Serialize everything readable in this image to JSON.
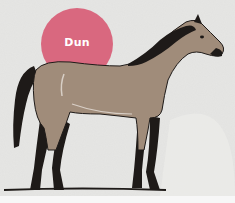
{
  "image": {
    "description": "Illustration of a dun-colored horse standing in profile facing right, with a circular badge label",
    "badge": {
      "label": "Dun",
      "color": "#d9687f"
    },
    "colors": {
      "background": "#e2e2e0",
      "horse_body": "#a08c7a",
      "mane_tail_legs": "#1e1a18",
      "ground_line": "#1e1a18",
      "bottom_strip": "#f7f7f7"
    }
  }
}
